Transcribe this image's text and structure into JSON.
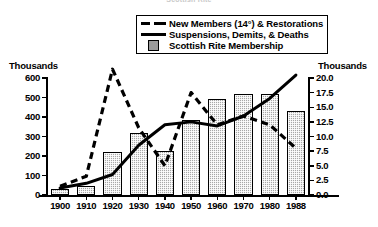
{
  "figure": {
    "top_caption": "Scottish Rite"
  },
  "legend": {
    "position": "top-center",
    "items": [
      {
        "key": "dashed-line",
        "label": "New Members (14°) & Restorations"
      },
      {
        "key": "solid-line",
        "label": "Suspensions, Demits, & Deaths"
      },
      {
        "key": "filled-box",
        "label": "Scottish Rite Membership"
      }
    ]
  },
  "axes": {
    "left_title": "Thousands",
    "right_title": "Thousands",
    "left_ticks": [
      "600",
      "500",
      "400",
      "300",
      "200",
      "100",
      "0"
    ],
    "right_ticks": [
      "20.0",
      "17.5",
      "15.0",
      "12.5",
      "10.0",
      "7.5",
      "5.0",
      "2.5",
      "0.0"
    ]
  },
  "chart_data": {
    "type": "bar",
    "title": "Scottish Rite",
    "xlabel": "",
    "ylabel": "Thousands",
    "y2label": "Thousands",
    "ylim": [
      0,
      600
    ],
    "y2lim": [
      0,
      20
    ],
    "grid": false,
    "legend_position": "top-center",
    "categories": [
      "1900",
      "1910",
      "1920",
      "1930",
      "1940",
      "1950",
      "1960",
      "1970",
      "1980",
      "1988"
    ],
    "x": [
      1900,
      1910,
      1920,
      1930,
      1940,
      1950,
      1960,
      1970,
      1980,
      1988
    ],
    "series": [
      {
        "name": "Scottish Rite Membership",
        "type": "bar",
        "axis": "left",
        "unit": "thousands",
        "color": "#a8a8a8",
        "values": [
          30,
          45,
          220,
          320,
          225,
          385,
          490,
          520,
          520,
          430
        ]
      },
      {
        "name": "New Members (14°) & Restorations",
        "type": "line",
        "style": "dashed",
        "axis": "right",
        "unit": "thousands",
        "color": "#000000",
        "values": [
          1.5,
          3.2,
          21.5,
          11.5,
          5.0,
          17.5,
          12.0,
          13.5,
          12.0,
          8.0
        ]
      },
      {
        "name": "Suspensions, Demits, & Deaths",
        "type": "line",
        "style": "solid",
        "axis": "right",
        "unit": "thousands",
        "color": "#000000",
        "values": [
          1.2,
          2.0,
          3.5,
          8.5,
          12.0,
          12.5,
          11.8,
          13.5,
          16.5,
          20.5
        ]
      }
    ]
  }
}
